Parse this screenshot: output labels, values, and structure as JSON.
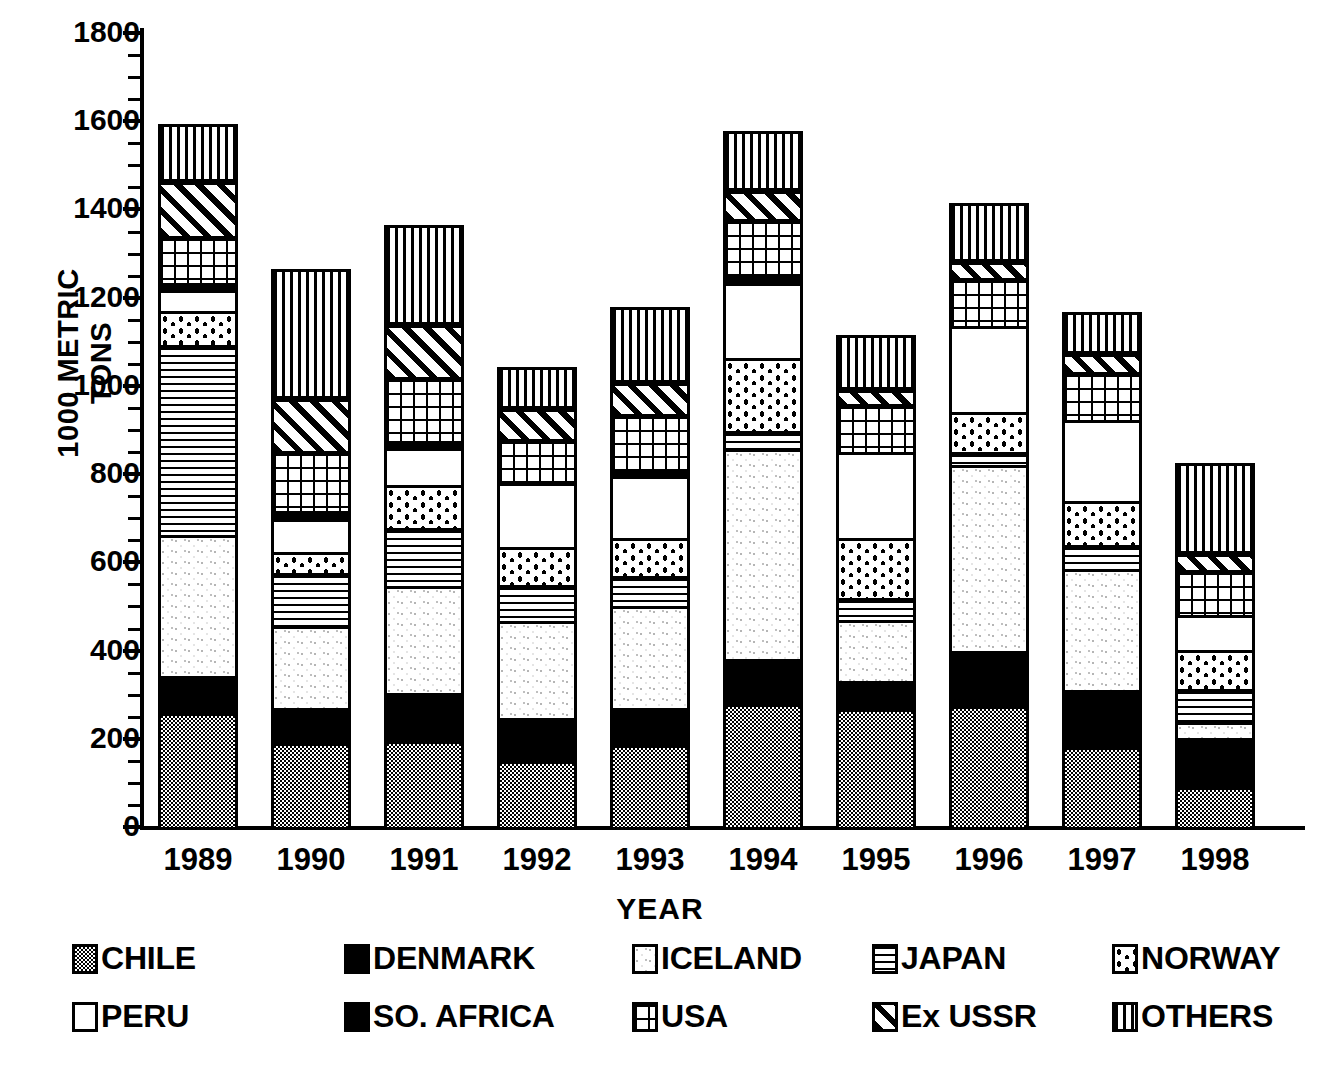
{
  "chart_data": {
    "type": "bar",
    "subtype": "stacked",
    "title": "",
    "xlabel": "YEAR",
    "ylabel": "1000 METRIC TONS",
    "ylim": [
      0,
      1800
    ],
    "ytick_step": 200,
    "yticks": [
      "0",
      "200",
      "400",
      "600",
      "800",
      "1000",
      "1200",
      "1400",
      "1600",
      "1800"
    ],
    "grid": false,
    "legend_position": "bottom",
    "categories": [
      "1989",
      "1990",
      "1991",
      "1992",
      "1993",
      "1994",
      "1995",
      "1996",
      "1997",
      "1998"
    ],
    "series": [
      {
        "name": "CHILE",
        "pattern": "fine-stipple",
        "values": [
          258,
          190,
          196,
          150,
          185,
          280,
          268,
          275,
          182,
          90
        ]
      },
      {
        "name": "DENMARK",
        "pattern": "bold-dot-grid",
        "values": [
          84,
          80,
          108,
          98,
          85,
          100,
          62,
          125,
          128,
          112
        ]
      },
      {
        "name": "ICELAND",
        "pattern": "light-speckle",
        "values": [
          320,
          185,
          243,
          220,
          230,
          478,
          140,
          420,
          275,
          35
        ]
      },
      {
        "name": "JAPAN",
        "pattern": "horizontal-lines",
        "values": [
          430,
          120,
          132,
          80,
          68,
          40,
          50,
          30,
          55,
          75
        ]
      },
      {
        "name": "NORWAY",
        "pattern": "oval-dots",
        "values": [
          77,
          48,
          96,
          88,
          88,
          165,
          135,
          90,
          100,
          90
        ]
      },
      {
        "name": "PERU",
        "pattern": "white",
        "values": [
          48,
          76,
          85,
          143,
          140,
          170,
          195,
          195,
          182,
          78
        ]
      },
      {
        "name": "SO. AFRICA",
        "pattern": "solid-black",
        "values": [
          17,
          18,
          16,
          0,
          13,
          20,
          0,
          0,
          0,
          0
        ]
      },
      {
        "name": "USA",
        "pattern": "square-grid",
        "values": [
          105,
          135,
          145,
          100,
          127,
          125,
          110,
          110,
          110,
          102
        ]
      },
      {
        "name": "Ex USSR",
        "pattern": "diagonal-hatch",
        "values": [
          123,
          118,
          118,
          68,
          70,
          65,
          30,
          35,
          40,
          38
        ]
      },
      {
        "name": "OTHERS",
        "pattern": "vertical-lines",
        "values": [
          133,
          295,
          227,
          95,
          173,
          135,
          125,
          135,
          95,
          205
        ]
      }
    ],
    "totals": [
      1595,
      1265,
      1366,
      1042,
      1179,
      1578,
      1115,
      1415,
      1167,
      825
    ]
  },
  "axis": {
    "y_title": "1000 METRIC TONS",
    "x_title": "YEAR"
  },
  "legend": {
    "rows": [
      [
        {
          "label": "CHILE",
          "pattern": "p-chile"
        },
        {
          "label": "DENMARK",
          "pattern": "p-denmark"
        },
        {
          "label": "ICELAND",
          "pattern": "p-iceland"
        },
        {
          "label": "JAPAN",
          "pattern": "p-japan"
        },
        {
          "label": "NORWAY",
          "pattern": "p-norway"
        }
      ],
      [
        {
          "label": "PERU",
          "pattern": "p-peru"
        },
        {
          "label": "SO. AFRICA",
          "pattern": "p-soafrica"
        },
        {
          "label": "USA",
          "pattern": "p-usa"
        },
        {
          "label": "Ex USSR",
          "pattern": "p-exussr"
        },
        {
          "label": "OTHERS",
          "pattern": "p-others"
        }
      ]
    ]
  },
  "colors": {
    "ink": "#000000",
    "paper": "#ffffff"
  }
}
